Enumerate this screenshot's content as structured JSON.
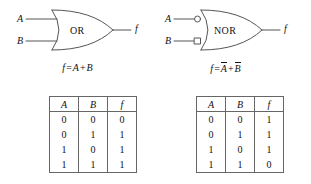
{
  "figure": {
    "panels": [
      {
        "id": "or-gate",
        "gate_label": "OR",
        "input_labels": [
          "A",
          "B"
        ],
        "output_label": "f",
        "inverted_inputs": false,
        "equation": {
          "lhs": "f",
          "eq": "=",
          "term1": "A",
          "term1_bar": false,
          "operator": "+",
          "term2": "B",
          "term2_bar": false
        },
        "truth_table": {
          "headers": [
            "A",
            "B",
            "f"
          ],
          "rows": [
            [
              "0",
              "0",
              "0"
            ],
            [
              "0",
              "1",
              "1"
            ],
            [
              "1",
              "0",
              "1"
            ],
            [
              "1",
              "1",
              "1"
            ]
          ]
        }
      },
      {
        "id": "nor-gate",
        "gate_label": "NOR",
        "input_labels": [
          "A",
          "B"
        ],
        "output_label": "f",
        "inverted_inputs": true,
        "equation": {
          "lhs": "f",
          "eq": "=",
          "term1": "A",
          "term1_bar": true,
          "operator": "+",
          "term2": "B",
          "term2_bar": true
        },
        "truth_table": {
          "headers": [
            "A",
            "B",
            "f"
          ],
          "rows": [
            [
              "0",
              "0",
              "1"
            ],
            [
              "0",
              "1",
              "1"
            ],
            [
              "1",
              "0",
              "1"
            ],
            [
              "1",
              "1",
              "0"
            ]
          ]
        }
      }
    ],
    "colors": {
      "stroke": "#555555",
      "text": "#111111",
      "background": "#ffffff",
      "table_border": "#666666"
    }
  }
}
